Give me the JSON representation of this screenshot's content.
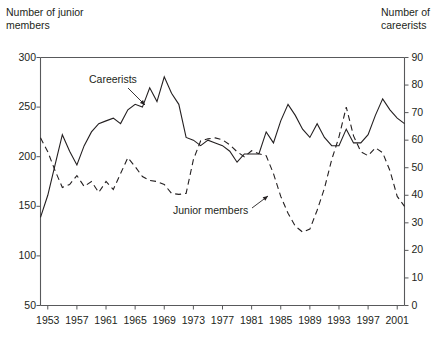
{
  "chart_data": {
    "type": "line",
    "title": "",
    "xlabel": "",
    "ylabel": "Number of junior members",
    "y2label": "Number of careerists",
    "grid": false,
    "legend_position": "inline-annotations",
    "xlim": [
      1952,
      2002
    ],
    "ylim": [
      50,
      300
    ],
    "y2lim": [
      0,
      90
    ],
    "ytick_labels_left": [
      "300",
      "250",
      "200",
      "150",
      "100",
      "50"
    ],
    "ytick_values_left": [
      300,
      250,
      200,
      150,
      100,
      50
    ],
    "ytick_labels_right": [
      "90",
      "80",
      "70",
      "60",
      "50",
      "40",
      "30",
      "20",
      "10",
      "0"
    ],
    "ytick_values_right": [
      90,
      80,
      70,
      60,
      50,
      40,
      30,
      20,
      10,
      0
    ],
    "xtick_labels": [
      "1953",
      "1957",
      "1961",
      "1965",
      "1969",
      "1973",
      "1977",
      "1981",
      "1985",
      "1989",
      "1993",
      "1997",
      "2001"
    ],
    "xtick_values": [
      1953,
      1957,
      1961,
      1965,
      1969,
      1973,
      1977,
      1981,
      1985,
      1989,
      1993,
      1997,
      2001
    ],
    "x": [
      1952,
      1953,
      1954,
      1955,
      1956,
      1957,
      1958,
      1959,
      1960,
      1961,
      1962,
      1963,
      1964,
      1965,
      1966,
      1967,
      1968,
      1969,
      1970,
      1971,
      1972,
      1973,
      1974,
      1975,
      1976,
      1977,
      1978,
      1979,
      1980,
      1981,
      1982,
      1983,
      1984,
      1985,
      1986,
      1987,
      1988,
      1989,
      1990,
      1991,
      1992,
      1993,
      1994,
      1995,
      1996,
      1997,
      1998,
      1999,
      2000,
      2001,
      2002
    ],
    "series": [
      {
        "name": "Careerists",
        "axis": "right",
        "style": "solid",
        "color": "#231f20",
        "values": [
          32,
          40,
          51,
          62,
          56,
          51,
          58,
          63,
          66,
          67,
          68,
          66,
          71,
          73,
          72,
          79,
          74,
          83,
          77,
          73,
          61,
          60,
          58,
          60,
          59,
          58,
          56,
          52,
          55,
          55,
          55,
          63,
          59,
          67,
          73,
          69,
          64,
          61,
          66,
          61,
          58,
          58,
          64,
          59,
          59,
          62,
          69,
          75,
          71,
          68,
          66
        ]
      },
      {
        "name": "Junior members",
        "axis": "left",
        "style": "dashed",
        "color": "#231f20",
        "values": [
          219,
          205,
          186,
          169,
          172,
          181,
          170,
          175,
          164,
          175,
          167,
          183,
          199,
          190,
          180,
          176,
          175,
          172,
          163,
          162,
          163,
          197,
          216,
          218,
          219,
          217,
          212,
          205,
          200,
          206,
          203,
          201,
          183,
          160,
          143,
          130,
          124,
          127,
          146,
          168,
          197,
          220,
          250,
          221,
          205,
          201,
          209,
          204,
          186,
          160,
          150
        ]
      }
    ],
    "annotations": [
      {
        "text": "Careerists",
        "x": 1961,
        "y": 255
      },
      {
        "text": "Junior members",
        "x": 1982,
        "y": 152
      }
    ]
  },
  "labels": {
    "left_axis_title": "Number of junior\nmembers",
    "right_axis_title": "Number of\ncareerists",
    "careerists": "Careerists",
    "junior_members": "Junior members"
  }
}
